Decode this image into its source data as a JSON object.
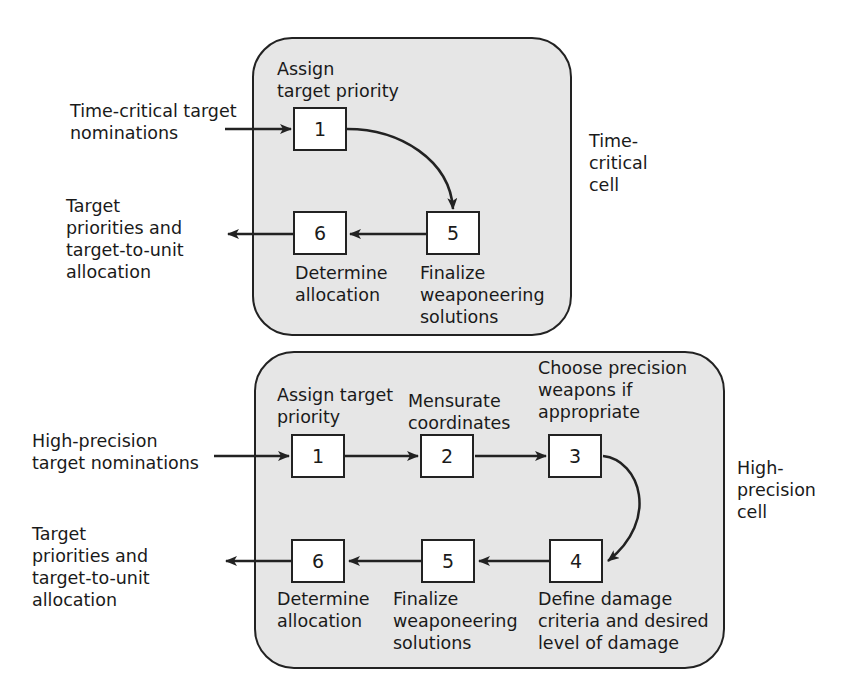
{
  "time_critical": {
    "cell_label": "Time-\ncritical\ncell",
    "input_label": "Time-critical target\nnominations",
    "output_label": "Target\npriorities and\ntarget-to-unit\nallocation",
    "steps": [
      {
        "number": "1",
        "label": "Assign\ntarget priority"
      },
      {
        "number": "5",
        "label": "Finalize\nweaponeering\nsolutions"
      },
      {
        "number": "6",
        "label": "Determine\nallocation"
      }
    ]
  },
  "high_precision": {
    "cell_label": "High-\nprecision\ncell",
    "input_label": "High-precision\ntarget nominations",
    "output_label": "Target\npriorities and\ntarget-to-unit\nallocation",
    "steps": [
      {
        "number": "1",
        "label": "Assign target\npriority"
      },
      {
        "number": "2",
        "label": "Mensurate\ncoordinates"
      },
      {
        "number": "3",
        "label": "Choose precision\nweapons if\nappropriate"
      },
      {
        "number": "4",
        "label": "Define damage\ncriteria and desired\nlevel of damage"
      },
      {
        "number": "5",
        "label": "Finalize\nweaponeering\nsolutions"
      },
      {
        "number": "6",
        "label": "Determine\nallocation"
      }
    ]
  },
  "colors": {
    "cell_fill": "#e6e6e6",
    "stroke": "#222222",
    "node_fill": "#ffffff"
  }
}
